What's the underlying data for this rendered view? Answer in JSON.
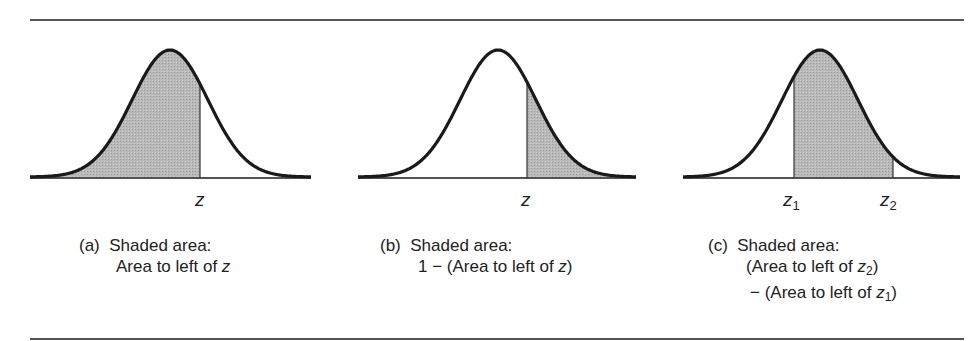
{
  "figure": {
    "panels": [
      {
        "id": "a",
        "axis_labels": [
          "z"
        ],
        "caption": {
          "letter": "(a)",
          "title": "Shaded area:",
          "lines": [
            "Area to left of z"
          ]
        },
        "shading": "left of z"
      },
      {
        "id": "b",
        "axis_labels": [
          "z"
        ],
        "caption": {
          "letter": "(b)",
          "title": "Shaded area:",
          "lines": [
            "1 − (Area to left of z)"
          ]
        },
        "shading": "right of z"
      },
      {
        "id": "c",
        "axis_labels": [
          "z1",
          "z2"
        ],
        "caption": {
          "letter": "(c)",
          "title": "Shaded area:",
          "lines": [
            "(Area to left of z2)",
            "− (Area to left of z1)"
          ]
        },
        "shading": "between z1 and z2"
      }
    ],
    "colors": {
      "curve": "#1a1a1a",
      "shade": "#b5b5b5",
      "rule": "#555555"
    }
  },
  "text": {
    "a_z": "z",
    "b_z": "z",
    "c_z": "z",
    "c_sub1": "1",
    "c_sub2": "2",
    "a_letter": "(a)",
    "a_title": "Shaded area:",
    "a_line1_pre": "Area to left of ",
    "a_line1_var": "z",
    "b_letter": "(b)",
    "b_title": "Shaded area:",
    "b_line1_pre": "1 − (Area to left of ",
    "b_line1_var": "z",
    "b_line1_post": ")",
    "c_letter": "(c)",
    "c_title": "Shaded area:",
    "c_line1_pre": "(Area to left of ",
    "c_line1_var": "z",
    "c_line1_sub": "2",
    "c_line1_post": ")",
    "c_line2_pre": "− (Area to left of ",
    "c_line2_var": "z",
    "c_line2_sub": "1",
    "c_line2_post": ")"
  }
}
